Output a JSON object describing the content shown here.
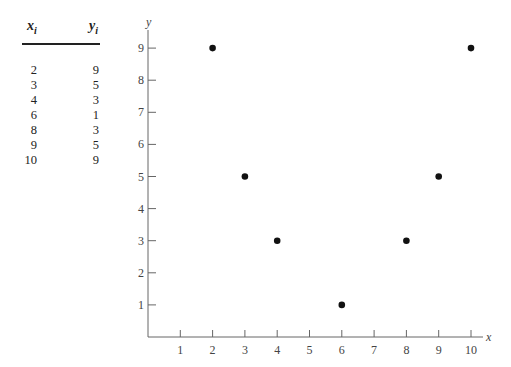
{
  "table": {
    "headers": {
      "x": "x",
      "x_sub": "i",
      "y": "y",
      "y_sub": "i"
    },
    "rows": [
      {
        "x": "2",
        "y": "9"
      },
      {
        "x": "3",
        "y": "5"
      },
      {
        "x": "4",
        "y": "3"
      },
      {
        "x": "6",
        "y": "1"
      },
      {
        "x": "8",
        "y": "3"
      },
      {
        "x": "9",
        "y": "5"
      },
      {
        "x": "10",
        "y": "9"
      }
    ]
  },
  "chart_data": {
    "type": "scatter",
    "title": "",
    "xlabel": "x",
    "ylabel": "y",
    "xlim": [
      0,
      10.5
    ],
    "ylim": [
      0,
      9.5
    ],
    "xticks": [
      1,
      2,
      3,
      4,
      5,
      6,
      7,
      8,
      9,
      10
    ],
    "yticks": [
      1,
      2,
      3,
      4,
      5,
      6,
      7,
      8,
      9
    ],
    "grid": false,
    "legend": "none",
    "series": [
      {
        "name": "data",
        "x": [
          2,
          3,
          4,
          6,
          8,
          9,
          10
        ],
        "y": [
          9,
          5,
          3,
          1,
          3,
          5,
          9
        ],
        "color": "#111111"
      }
    ]
  }
}
